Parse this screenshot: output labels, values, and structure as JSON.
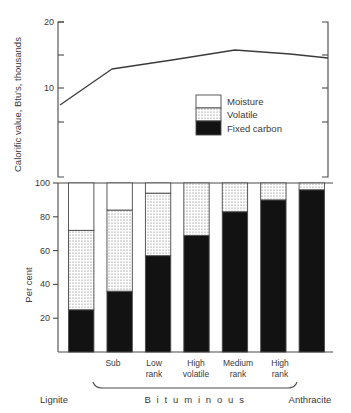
{
  "chart_data": [
    {
      "type": "line",
      "title": "",
      "ylabel": "Calorific value, Btu's, thousands",
      "xlabel": "",
      "ylim": [
        0,
        20
      ],
      "ytick_labels": [
        "20",
        "10"
      ],
      "ytick_values": [
        20,
        10
      ],
      "yminor_ticks": [
        15,
        5,
        0
      ],
      "grid": false,
      "x": [
        "Lignite",
        "Sub",
        "Low rank",
        "High volatile",
        "Medium rank",
        "High rank",
        "Anthracite"
      ],
      "values": [
        7.0,
        11.3,
        12.6,
        14.0,
        15.3,
        15.0,
        14.5
      ],
      "legend": {
        "position": "inside-lower-right",
        "entries": [
          {
            "label": "Moisture",
            "pattern": "white",
            "color": "#ffffff"
          },
          {
            "label": "Volatile",
            "pattern": "dotted",
            "color": "#d6d6d6"
          },
          {
            "label": "Fixed carbon",
            "pattern": "solid",
            "color": "#121212"
          }
        ]
      }
    },
    {
      "type": "bar",
      "stacked": true,
      "title": "",
      "ylabel": "Per cent",
      "xlabel": "",
      "ylim": [
        0,
        100
      ],
      "ytick_labels": [
        "100",
        "80",
        "60",
        "40",
        "20"
      ],
      "ytick_values": [
        100,
        80,
        60,
        40,
        20
      ],
      "grid": false,
      "categories": [
        "Lignite",
        "Sub",
        "Low rank",
        "High volatile",
        "Medium rank",
        "High rank",
        "Anthracite"
      ],
      "category_labels_shown": [
        "",
        "Sub",
        "Low rank",
        "High volatile",
        "Medium rank",
        "High rank",
        ""
      ],
      "series": [
        {
          "name": "Fixed carbon",
          "values": [
            25,
            36,
            57,
            69,
            83,
            90,
            96
          ]
        },
        {
          "name": "Volatile",
          "values": [
            47,
            48,
            37,
            31,
            17,
            10,
            4
          ]
        },
        {
          "name": "Moisture",
          "values": [
            28,
            16,
            6,
            0,
            0,
            0,
            0
          ]
        }
      ],
      "cumulative_tops": {
        "fixed_carbon": [
          25,
          36,
          57,
          69,
          83,
          90,
          96
        ],
        "volatile": [
          72,
          84,
          94,
          100,
          100,
          100,
          100
        ],
        "moisture": [
          100,
          100,
          100,
          100,
          100,
          100,
          100
        ]
      },
      "group_bracket": {
        "label": "B i t u m i n o u s",
        "covers": [
          "Sub",
          "Low rank",
          "High volatile",
          "Medium rank",
          "High rank"
        ]
      },
      "end_labels": {
        "left": "Lignite",
        "right": "Anthracite"
      }
    }
  ],
  "top_chart": {
    "y_axis_title": "Calorific value, Btu's, thousands",
    "ticks": [
      "20",
      "10"
    ]
  },
  "bottom_chart": {
    "y_axis_title": "Per cent",
    "ticks": [
      "100",
      "80",
      "60",
      "40",
      "20"
    ],
    "category_labels": [
      {
        "line1": "Sub",
        "line2": ""
      },
      {
        "line1": "Low",
        "line2": "rank"
      },
      {
        "line1": "High",
        "line2": "volatile"
      },
      {
        "line1": "Medium",
        "line2": "rank"
      },
      {
        "line1": "High",
        "line2": "rank"
      }
    ],
    "bracket_label": "B i t u m i n o u s",
    "left_label": "Lignite",
    "right_label": "Anthracite"
  },
  "legend": {
    "moisture": "Moisture",
    "volatile": "Volatile",
    "fixed_carbon": "Fixed carbon"
  },
  "colors": {
    "ink": "#3a3a3a",
    "axis": "#4a4a4a",
    "fixed_carbon": "#121212",
    "volatile_dots": "#767676",
    "moisture": "#ffffff"
  }
}
